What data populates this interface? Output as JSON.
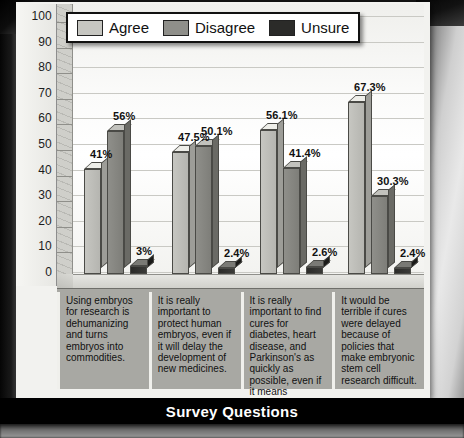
{
  "chart_data": {
    "type": "bar",
    "title": "",
    "xlabel": "Survey Questions",
    "ylabel": "",
    "ylim": [
      0,
      100
    ],
    "yticks": [
      100,
      90,
      80,
      70,
      60,
      50,
      40,
      30,
      20,
      10,
      0
    ],
    "grid": true,
    "legend_position": "top-left",
    "categories": [
      "Using embryos for research is dehumanizing and turns embryos into commodities.",
      "It is really important to protect human embryos, even if it will delay the development of new medicines.",
      "It is really important to find cures for diabetes, heart disease, and Parkinson's as quickly as possible, even if it means destroying embryos to do so.",
      "It would be terrible if cures were delayed because of policies that make embryonic stem cell research difficult."
    ],
    "series": [
      {
        "name": "Agree",
        "color": "#c6c6c1",
        "values": [
          41,
          47.5,
          56.1,
          67.3
        ],
        "labels": [
          "41%",
          "47.5%",
          "56.1%",
          "67.3%"
        ]
      },
      {
        "name": "Disagree",
        "color": "#8f8f8a",
        "values": [
          56,
          50.1,
          41.4,
          30.3
        ],
        "labels": [
          "56%",
          "50.1%",
          "41.4%",
          "30.3%"
        ]
      },
      {
        "name": "Unsure",
        "color": "#2b2b29",
        "values": [
          3,
          2.4,
          2.6,
          2.4
        ],
        "labels": [
          "3%",
          "2.4%",
          "2.6%",
          "2.4%"
        ]
      }
    ]
  },
  "legend": {
    "items": [
      {
        "label": "Agree"
      },
      {
        "label": "Disagree"
      },
      {
        "label": "Unsure"
      }
    ]
  },
  "axis": {
    "x_title": "Survey Questions"
  }
}
